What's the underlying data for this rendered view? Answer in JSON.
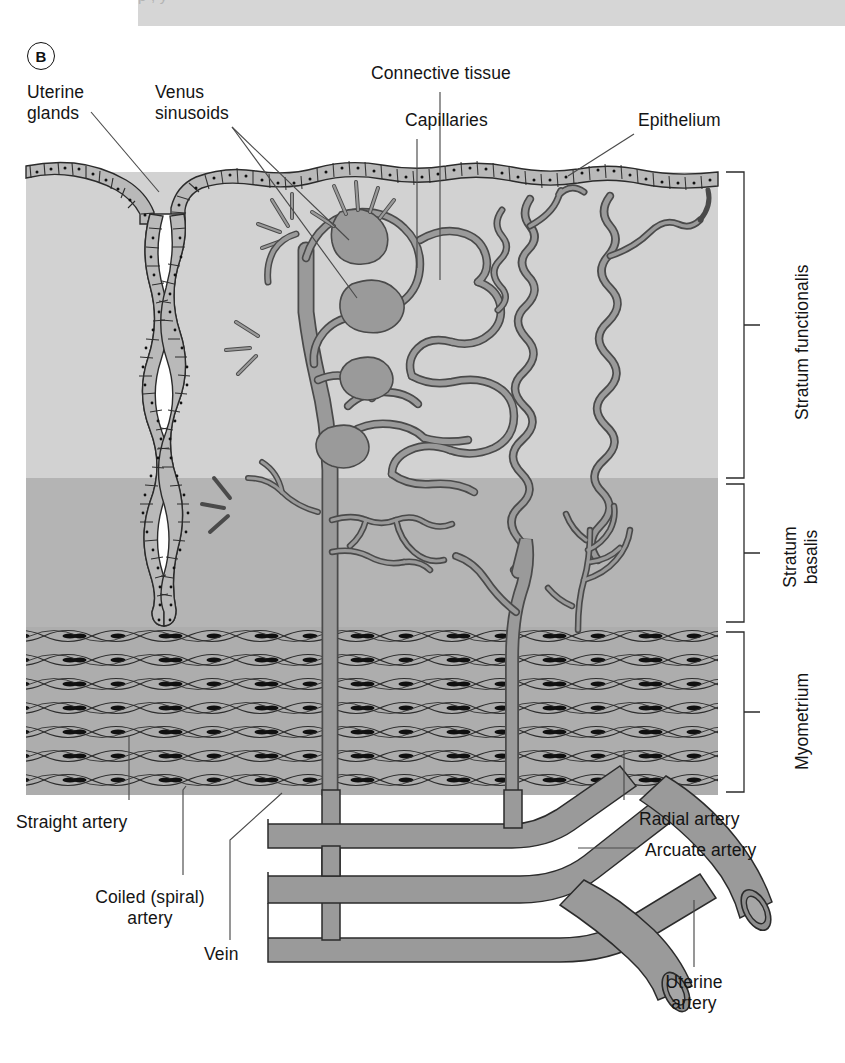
{
  "figure": {
    "panel_letter": "B",
    "caption_ghost": "p             ,  y"
  },
  "colors": {
    "stratum_functionalis": "#d2d2d2",
    "stratum_basalis": "#b4b4b4",
    "myometrium": "#b0b0b0",
    "vessel_fill": "#9a9a9a",
    "vessel_stroke": "#4a4a4a",
    "epithelium_fill": "#b9b9b9",
    "gland_lumen": "#ffffff",
    "outline": "#2b2b2b",
    "leader": "#4a4a4a",
    "caption_bar": "#d6d6d6",
    "text": "#141414"
  },
  "labels": {
    "uterine_glands": "Uterine\nglands",
    "venus_sinusoids": "Venus\nsinusoids",
    "connective_tissue": "Connective tissue",
    "capillaries": "Capillaries",
    "epithelium": "Epithelium",
    "stratum_functionalis": "Stratum functionalis",
    "stratum_basalis": "Stratum\nbasalis",
    "myometrium": "Myometrium",
    "straight_artery": "Straight artery",
    "coiled_spiral_artery": "Coiled (spiral)\nartery",
    "vein": "Vein",
    "radial_artery": "Radial artery",
    "arcuate_artery": "Arcuate artery",
    "uterine_artery": "Uterine\nartery"
  },
  "layers": [
    {
      "name": "Stratum functionalis",
      "top": 172,
      "bottom": 478,
      "fill": "#d2d2d2"
    },
    {
      "name": "Stratum basalis",
      "top": 478,
      "bottom": 627,
      "fill": "#b4b4b4"
    },
    {
      "name": "Myometrium",
      "top": 627,
      "bottom": 795,
      "fill": "#b0b0b0"
    }
  ],
  "brackets": [
    {
      "label": "Stratum functionalis",
      "top": 172,
      "bottom": 478
    },
    {
      "label": "Stratum basalis",
      "top": 481,
      "bottom": 624
    },
    {
      "label": "Myometrium",
      "top": 630,
      "bottom": 793
    }
  ],
  "structures": [
    "epithelium",
    "uterine-gland",
    "venous-sinusoid",
    "capillary-network",
    "coiled-spiral-artery",
    "straight-artery",
    "radial-artery",
    "arcuate-artery",
    "uterine-artery",
    "vein",
    "smooth-muscle-cells"
  ]
}
